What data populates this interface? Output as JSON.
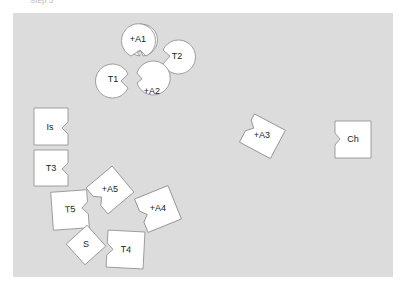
{
  "caption": "Step 5",
  "board": {
    "background": "#dcdcdc"
  },
  "pieces": [
    {
      "id": "A1",
      "label": "+A1",
      "shape": "circle-notch"
    },
    {
      "id": "T2",
      "label": "T2",
      "shape": "circle-notch"
    },
    {
      "id": "T1",
      "label": "T1",
      "shape": "circle-notch"
    },
    {
      "id": "A2",
      "label": "+A2",
      "shape": "circle-notch"
    },
    {
      "id": "Is",
      "label": "Is",
      "shape": "square-notch"
    },
    {
      "id": "T3",
      "label": "T3",
      "shape": "square-notch"
    },
    {
      "id": "A3",
      "label": "+A3",
      "shape": "square-notch"
    },
    {
      "id": "Ch",
      "label": "Ch",
      "shape": "square-notch"
    },
    {
      "id": "A5",
      "label": "+A5",
      "shape": "square-notch"
    },
    {
      "id": "T5",
      "label": "T5",
      "shape": "square-notch"
    },
    {
      "id": "A4",
      "label": "+A4",
      "shape": "square-notch"
    },
    {
      "id": "S",
      "label": "S",
      "shape": "square-notch"
    },
    {
      "id": "T4",
      "label": "T4",
      "shape": "square-notch"
    }
  ]
}
